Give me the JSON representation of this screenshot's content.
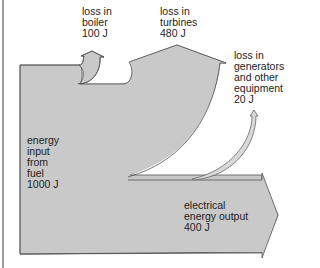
{
  "diagram": {
    "type": "sankey",
    "title": "",
    "colors": {
      "flow_fill": "#c9c9c9",
      "outline": "#555555",
      "text": "#222222"
    },
    "input": {
      "label": "energy\ninput\nfrom\nfuel\n1000 J",
      "value_j": 1000
    },
    "losses": [
      {
        "id": "boiler",
        "label": "loss in\nboiler\n100 J",
        "value_j": 100
      },
      {
        "id": "turbines",
        "label": "loss in\nturbines\n480 J",
        "value_j": 480
      },
      {
        "id": "generators",
        "label": "loss in\ngenerators\nand other\nequipment\n20 J",
        "value_j": 20
      }
    ],
    "output": {
      "label": "electrical\nenergy output\n400 J",
      "value_j": 400
    }
  }
}
